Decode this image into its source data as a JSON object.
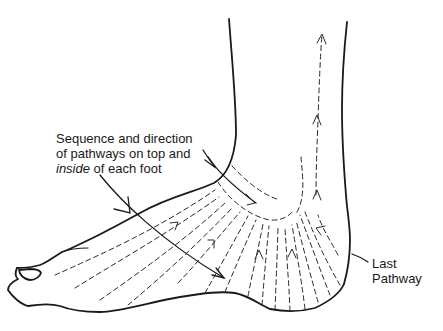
{
  "diagram": {
    "annotations": {
      "main": {
        "line1": "Sequence and direction",
        "line2": "of pathways on top and",
        "line3_italic": "inside",
        "line3_rest": " of each foot"
      },
      "last": {
        "line1": "Last",
        "line2": "Pathway"
      }
    },
    "colors": {
      "line": "#1a1a1a",
      "background": "#ffffff"
    }
  }
}
